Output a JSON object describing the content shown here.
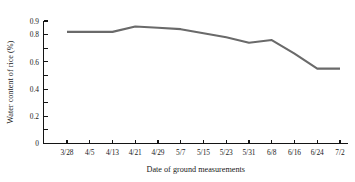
{
  "chart_data": {
    "type": "line",
    "title": "",
    "xlabel": "Date of ground measurements",
    "ylabel": "Water content of rice (%)",
    "categories": [
      "3/28",
      "4/5",
      "4/13",
      "4/21",
      "4/29",
      "5/7",
      "5/15",
      "5/23",
      "5/31",
      "6/8",
      "6/16",
      "6/24",
      "7/2"
    ],
    "values": [
      0.82,
      0.82,
      0.82,
      0.86,
      0.85,
      0.84,
      0.81,
      0.78,
      0.74,
      0.76,
      0.66,
      0.55,
      0.55
    ],
    "series": [
      {
        "name": "Water content of rice",
        "color": "#6a6a6a",
        "values": [
          0.82,
          0.82,
          0.82,
          0.86,
          0.85,
          0.84,
          0.81,
          0.78,
          0.74,
          0.76,
          0.66,
          0.55,
          0.55
        ]
      }
    ],
    "ylim": [
      0,
      0.9
    ],
    "y_ticks": [
      0,
      0.1,
      0.2,
      0.3,
      0.4,
      0.5,
      0.6,
      0.7,
      0.8,
      0.9
    ],
    "y_tick_labels": [
      "0",
      "",
      "0.2",
      "",
      "0.4",
      "",
      "0.6",
      "",
      "0.8",
      "0.9"
    ],
    "grid": false,
    "legend": false,
    "legend_position": "none",
    "line_color": "#6a6a6a",
    "axis_color": "#141414"
  },
  "axis": {
    "y_title": "Water content of rice (%)",
    "x_title": "Date of ground measurements",
    "y_labels": [
      "0.9",
      "0.8",
      "0.6",
      "0.4",
      "0.2",
      "0"
    ],
    "x_labels": [
      "3/28",
      "4/5",
      "4/13",
      "4/21",
      "4/29",
      "5/7",
      "5/15",
      "5/23",
      "5/31",
      "6/8",
      "6/16",
      "6/24",
      "7/2"
    ]
  }
}
